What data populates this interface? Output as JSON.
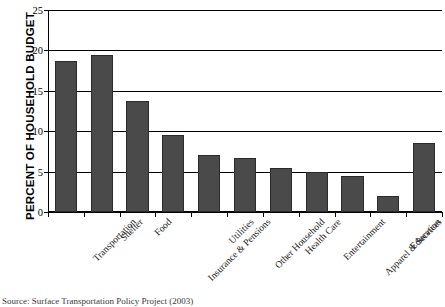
{
  "chart_data": {
    "type": "bar",
    "title": "",
    "xlabel": "",
    "ylabel": "PERCENT OF HOUSEHOLD BUDGET",
    "ylim": [
      0,
      25
    ],
    "yticks": [
      0,
      5,
      10,
      15,
      20,
      25
    ],
    "grid": true,
    "legend": null,
    "bar_color": "#4a4a4a",
    "categories": [
      "Transportation",
      "Shelter",
      "Food",
      "Insurance & Pensions",
      "Utilities",
      "Other Household",
      "Health Care",
      "Entertainment",
      "Apparel & Services",
      "Education",
      "Miscellaneous"
    ],
    "values": [
      18.7,
      19.4,
      13.7,
      9.5,
      7.0,
      6.7,
      5.4,
      5.0,
      4.4,
      2.0,
      8.6
    ]
  },
  "source": {
    "note": "Source: Surface Transportation Policy Project (2003)"
  }
}
